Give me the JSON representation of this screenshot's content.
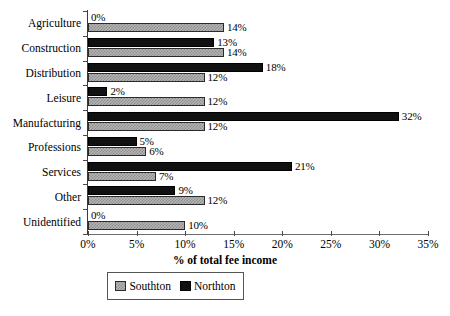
{
  "chart_data": {
    "type": "bar",
    "orientation": "horizontal",
    "title": "",
    "xlabel": "% of total fee income",
    "ylabel": "",
    "xlim": [
      0,
      35
    ],
    "xticks": [
      "0%",
      "5%",
      "10%",
      "15%",
      "20%",
      "25%",
      "30%",
      "35%"
    ],
    "xtick_values": [
      0,
      5,
      10,
      15,
      20,
      25,
      30,
      35
    ],
    "grid": false,
    "legend_position": "bottom",
    "categories": [
      "Agriculture",
      "Construction",
      "Distribution",
      "Leisure",
      "Manufacturing",
      "Professions",
      "Services",
      "Other",
      "Unidentified"
    ],
    "series": [
      {
        "name": "Northton",
        "color": "#111111",
        "pattern": "solid",
        "values": [
          0,
          13,
          18,
          2,
          32,
          5,
          21,
          9,
          0
        ],
        "labels": [
          "0%",
          "13%",
          "18%",
          "2%",
          "32%",
          "5%",
          "21%",
          "9%",
          "0%"
        ]
      },
      {
        "name": "Southton",
        "color": "#b4b4b4",
        "pattern": "checkered",
        "values": [
          14,
          14,
          12,
          12,
          12,
          6,
          7,
          12,
          10
        ],
        "labels": [
          "14%",
          "14%",
          "12%",
          "12%",
          "12%",
          "6%",
          "7%",
          "12%",
          "10%"
        ]
      }
    ]
  },
  "legend": {
    "entries": [
      {
        "label": "Southton",
        "swatch": "south"
      },
      {
        "label": "Northton",
        "swatch": "north"
      }
    ]
  }
}
